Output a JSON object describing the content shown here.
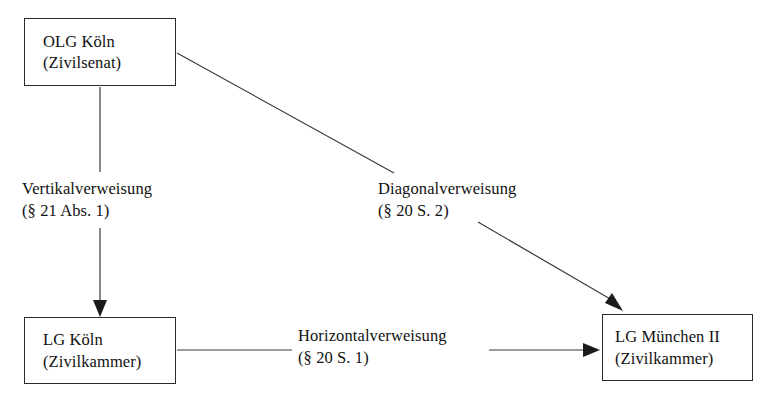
{
  "diagram": {
    "background_color": "#ffffff",
    "line_color": "#3a3a3a",
    "text_color": "#111111",
    "nodes": [
      {
        "id": "olg-koeln",
        "line1": "OLG Köln",
        "line2": "(Zivilsenat)"
      },
      {
        "id": "lg-koeln",
        "line1": "LG Köln",
        "line2": "(Zivilkammer)"
      },
      {
        "id": "lg-muenchen",
        "line1": "LG München II",
        "line2": "(Zivilkammer)"
      }
    ],
    "edges": [
      {
        "id": "vertical",
        "from": "olg-koeln",
        "to": "lg-koeln",
        "line1": "Vertikalverweisung",
        "line2": "(§ 21 Abs. 1)"
      },
      {
        "id": "diagonal",
        "from": "olg-koeln",
        "to": "lg-muenchen",
        "line1": "Diagonalverweisung",
        "line2": "(§ 20 S. 2)"
      },
      {
        "id": "horizontal",
        "from": "lg-koeln",
        "to": "lg-muenchen",
        "line1": "Horizontalverweisung",
        "line2": "(§ 20 S. 1)"
      }
    ]
  }
}
